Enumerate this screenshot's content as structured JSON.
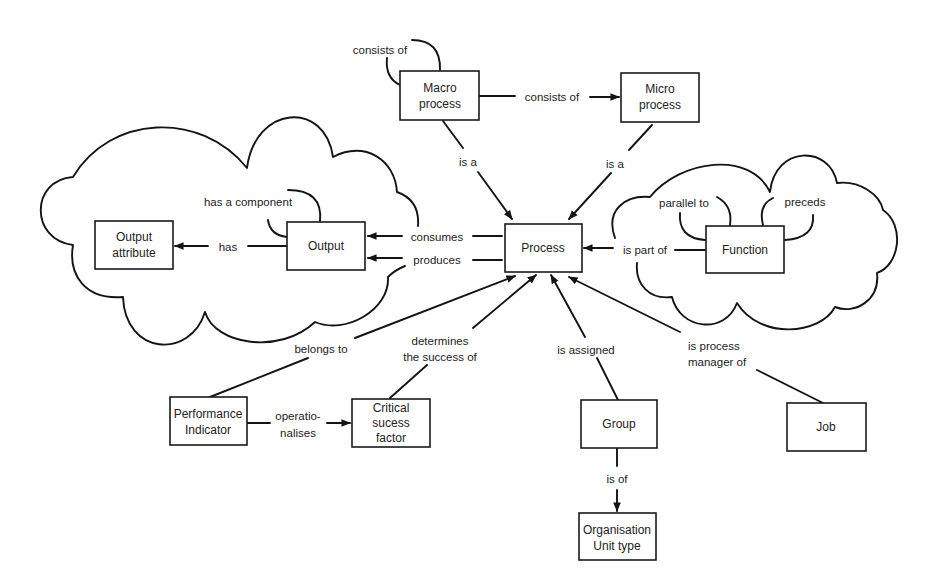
{
  "diagram": {
    "type": "process metamodel concept map",
    "nodes": [
      {
        "id": "macro_process",
        "lines": [
          "Macro",
          "process"
        ]
      },
      {
        "id": "micro_process",
        "lines": [
          "Micro",
          "process"
        ]
      },
      {
        "id": "process",
        "lines": [
          "Process"
        ]
      },
      {
        "id": "output",
        "lines": [
          "Output"
        ]
      },
      {
        "id": "output_attribute",
        "lines": [
          "Output",
          "attribute"
        ]
      },
      {
        "id": "function",
        "lines": [
          "Function"
        ]
      },
      {
        "id": "performance_indicator",
        "lines": [
          "Performance",
          "Indicator"
        ]
      },
      {
        "id": "critical_success_factor",
        "lines": [
          "Critical",
          "sucess",
          "factor"
        ]
      },
      {
        "id": "group",
        "lines": [
          "Group"
        ]
      },
      {
        "id": "job",
        "lines": [
          "Job"
        ]
      },
      {
        "id": "organisation_unit_type",
        "lines": [
          "Organisation",
          "Unit type"
        ]
      }
    ],
    "edges": [
      {
        "from": "macro_process",
        "to": "macro_process",
        "lines": [
          "consists of"
        ]
      },
      {
        "from": "macro_process",
        "to": "micro_process",
        "lines": [
          "consists of"
        ]
      },
      {
        "from": "macro_process",
        "to": "process",
        "lines": [
          "is a"
        ]
      },
      {
        "from": "micro_process",
        "to": "process",
        "lines": [
          "is a"
        ]
      },
      {
        "from": "output",
        "to": "output",
        "lines": [
          "has a component"
        ]
      },
      {
        "from": "output",
        "to": "output_attribute",
        "lines": [
          "has"
        ]
      },
      {
        "from": "process",
        "to": "output",
        "lines": [
          "consumes"
        ]
      },
      {
        "from": "process",
        "to": "output",
        "lines": [
          "produces"
        ]
      },
      {
        "from": "function",
        "to": "process",
        "lines": [
          "is part of"
        ]
      },
      {
        "from": "function",
        "to": "function",
        "lines": [
          "parallel to"
        ]
      },
      {
        "from": "function",
        "to": "function",
        "lines": [
          "preceds"
        ]
      },
      {
        "from": "performance_indicator",
        "to": "process",
        "lines": [
          "belongs to"
        ]
      },
      {
        "from": "critical_success_factor",
        "to": "process",
        "lines": [
          "determines",
          "the success of"
        ]
      },
      {
        "from": "group",
        "to": "process",
        "lines": [
          "is assigned"
        ]
      },
      {
        "from": "job",
        "to": "process",
        "lines": [
          "is process",
          "manager of"
        ]
      },
      {
        "from": "performance_indicator",
        "to": "critical_success_factor",
        "lines": [
          "operatio-",
          "nalises"
        ]
      },
      {
        "from": "group",
        "to": "organisation_unit_type",
        "lines": [
          "is of"
        ]
      }
    ],
    "groupings": [
      {
        "id": "output_cloud",
        "contains": [
          "output",
          "output_attribute"
        ]
      },
      {
        "id": "function_cloud",
        "contains": [
          "function"
        ]
      }
    ]
  }
}
